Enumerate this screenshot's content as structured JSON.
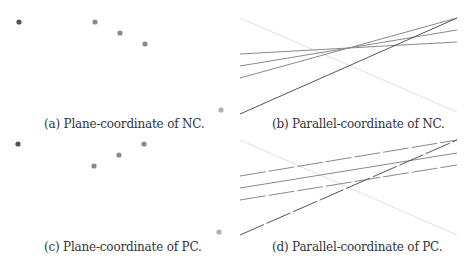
{
  "panels": [
    {
      "id": "a",
      "caption": "(a) Plane-coordinate of NC.",
      "type": "scatter",
      "points": [
        {
          "x": 19,
          "y": 22,
          "color": "#555555"
        },
        {
          "x": 95,
          "y": 22,
          "color": "#8a8a8a"
        },
        {
          "x": 120,
          "y": 33,
          "color": "#8a8a8a"
        },
        {
          "x": 145,
          "y": 44,
          "color": "#8a8a8a"
        },
        {
          "x": 221,
          "y": 110,
          "color": "#b0b0b0"
        }
      ]
    },
    {
      "id": "b",
      "caption": "(b) Parallel-coordinate of NC.",
      "type": "parallel",
      "lines": [
        {
          "x1": 240,
          "y1": 18,
          "x2": 457,
          "y2": 112,
          "color": "#e0e0e0",
          "dashed": false
        },
        {
          "x1": 240,
          "y1": 54,
          "x2": 457,
          "y2": 42,
          "color": "#8a8a8a",
          "dashed": false
        },
        {
          "x1": 240,
          "y1": 66,
          "x2": 457,
          "y2": 30,
          "color": "#8a8a8a",
          "dashed": false
        },
        {
          "x1": 240,
          "y1": 78,
          "x2": 457,
          "y2": 18,
          "color": "#8a8a8a",
          "dashed": false
        },
        {
          "x1": 240,
          "y1": 114,
          "x2": 457,
          "y2": 18,
          "color": "#555555",
          "dashed": false
        }
      ]
    },
    {
      "id": "c",
      "caption": "(c) Plane-coordinate of PC.",
      "type": "scatter",
      "points": [
        {
          "x": 18,
          "y": 144,
          "color": "#555555"
        },
        {
          "x": 144,
          "y": 144,
          "color": "#8a8a8a"
        },
        {
          "x": 119,
          "y": 155,
          "color": "#8a8a8a"
        },
        {
          "x": 94,
          "y": 166,
          "color": "#8a8a8a"
        },
        {
          "x": 219,
          "y": 232,
          "color": "#b0b0b0"
        }
      ]
    },
    {
      "id": "d",
      "caption": "(d) Parallel-coordinate of PC.",
      "type": "parallel",
      "lines": [
        {
          "x1": 240,
          "y1": 140,
          "x2": 457,
          "y2": 235,
          "color": "#e0e0e0",
          "dashed": false
        },
        {
          "x1": 240,
          "y1": 176,
          "x2": 457,
          "y2": 140,
          "color": "#8a8a8a",
          "dashed": true
        },
        {
          "x1": 240,
          "y1": 188,
          "x2": 457,
          "y2": 153,
          "color": "#8a8a8a",
          "dashed": false
        },
        {
          "x1": 240,
          "y1": 200,
          "x2": 457,
          "y2": 165,
          "color": "#8a8a8a",
          "dashed": true
        },
        {
          "x1": 240,
          "y1": 235,
          "x2": 457,
          "y2": 140,
          "color": "#555555",
          "dashed": true
        }
      ]
    }
  ],
  "captions": {
    "a": "(a) Plane-coordinate of NC.",
    "b": "(b) Parallel-coordinate of NC.",
    "c": "(c) Plane-coordinate of PC.",
    "d": "(d) Parallel-coordinate of PC."
  }
}
